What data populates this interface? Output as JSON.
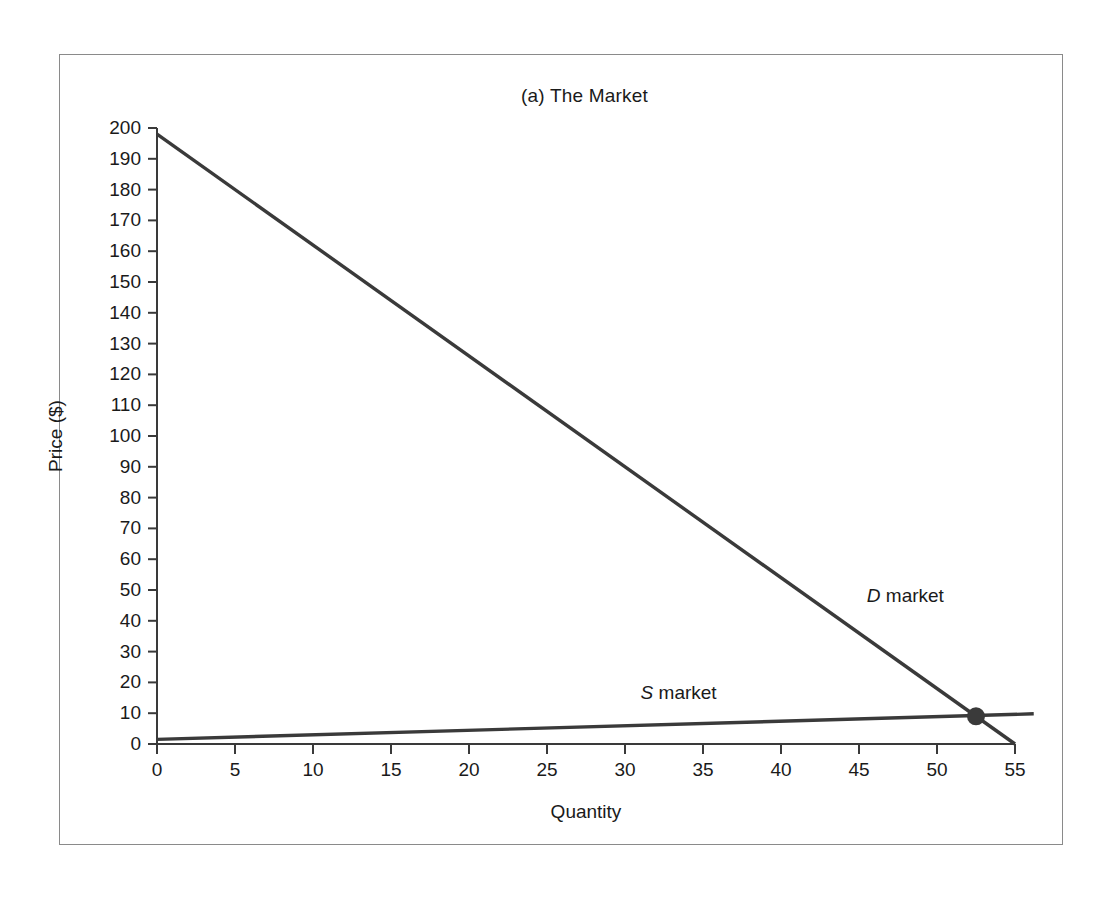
{
  "figure": {
    "title": "(a) The Market",
    "frame_color": "#8a8a8a",
    "background": "#ffffff"
  },
  "chart_data": {
    "type": "line",
    "title": "(a) The Market",
    "xlabel": "Quantity",
    "ylabel": "Price ($)",
    "xlim": [
      0,
      55
    ],
    "ylim": [
      0,
      200
    ],
    "grid": false,
    "legend": "inline-annotations",
    "line_color": "#3a3a3a",
    "xticks": [
      0,
      5,
      10,
      15,
      20,
      25,
      30,
      35,
      40,
      45,
      50,
      55
    ],
    "xtick_labels": [
      "0",
      "5",
      "10",
      "15",
      "20",
      "25",
      "30",
      "35",
      "40",
      "45",
      "50",
      "55"
    ],
    "yticks": [
      0,
      10,
      20,
      30,
      40,
      50,
      60,
      70,
      80,
      90,
      100,
      110,
      120,
      130,
      140,
      150,
      160,
      170,
      180,
      190,
      200
    ],
    "ytick_labels": [
      "0",
      "10",
      "20",
      "30",
      "40",
      "50",
      "60",
      "70",
      "80",
      "90",
      "100",
      "110",
      "120",
      "130",
      "140",
      "150",
      "160",
      "170",
      "180",
      "190",
      "200"
    ],
    "series": [
      {
        "name": "D market",
        "label_prefix": "D",
        "label_suffix": " market",
        "points": [
          [
            0,
            198
          ],
          [
            55,
            0
          ]
        ],
        "label_x": 45.5,
        "label_y": 46
      },
      {
        "name": "S market",
        "label_prefix": "S",
        "label_suffix": " market",
        "points": [
          [
            0,
            1.5
          ],
          [
            56.2,
            9.8
          ]
        ],
        "label_x": 31.0,
        "label_y": 14.5
      }
    ],
    "annotations": [
      {
        "name": "equilibrium-point",
        "type": "marker",
        "x": 52.5,
        "y": 9.0,
        "radius": 9,
        "color": "#3a3a3a"
      }
    ]
  }
}
